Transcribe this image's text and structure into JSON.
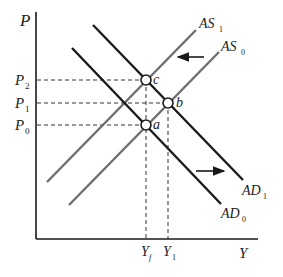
{
  "diagram": {
    "axes": {
      "y_label": "P",
      "x_label": "Y"
    },
    "price_levels": [
      {
        "base": "P",
        "sub": "2",
        "y": 80
      },
      {
        "base": "P",
        "sub": "1",
        "y": 103
      },
      {
        "base": "P",
        "sub": "0",
        "y": 125
      }
    ],
    "output_levels": [
      {
        "base": "Y",
        "sub": "f",
        "x": 146
      },
      {
        "base": "Y",
        "sub": "1",
        "x": 168
      }
    ],
    "curves": [
      {
        "id": "AS1",
        "base": "AS",
        "sub": "1",
        "color": "#6e6e6e"
      },
      {
        "id": "AS0",
        "base": "AS",
        "sub": "0",
        "color": "#6e6e6e"
      },
      {
        "id": "AD1",
        "base": "AD",
        "sub": "1",
        "color": "#1a1a1a"
      },
      {
        "id": "AD0",
        "base": "AD",
        "sub": "0",
        "color": "#1a1a1a"
      }
    ],
    "points": [
      {
        "label": "a",
        "x": 146,
        "y": 125
      },
      {
        "label": "b",
        "x": 168,
        "y": 103
      },
      {
        "label": "c",
        "x": 146,
        "y": 80
      }
    ],
    "arrows": [
      {
        "name": "as-shift-left",
        "direction": "left"
      },
      {
        "name": "ad-shift-right",
        "direction": "right"
      }
    ]
  }
}
